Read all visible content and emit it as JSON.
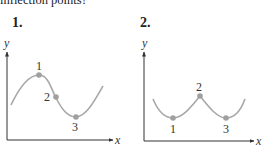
{
  "question": {
    "text": "inflection points?"
  },
  "panels": [
    {
      "number": "1.",
      "axes": {
        "x_label": "x",
        "y_label": "y"
      },
      "points": [
        {
          "label": "1",
          "role": "local maximum"
        },
        {
          "label": "2",
          "role": "inflection point"
        },
        {
          "label": "3",
          "role": "local minimum"
        }
      ]
    },
    {
      "number": "2.",
      "axes": {
        "x_label": "x",
        "y_label": "y"
      },
      "points": [
        {
          "label": "1",
          "role": "local minimum"
        },
        {
          "label": "2",
          "role": "cusp / local maximum"
        },
        {
          "label": "3",
          "role": "local minimum"
        }
      ]
    }
  ],
  "colors": {
    "curve": "#a8a8a8",
    "point": "#a0a0a0",
    "axis": "#333333",
    "text": "#222222"
  }
}
